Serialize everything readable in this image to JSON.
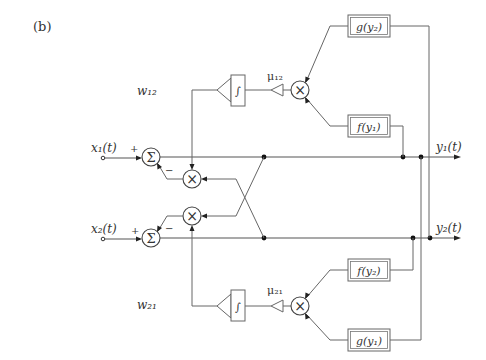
{
  "figure": {
    "panel_label": "(b)",
    "inputs": [
      {
        "label": "x₁(t)",
        "sum_plus": "+",
        "sum_minus": "−"
      },
      {
        "label": "x₂(t)",
        "sum_plus": "+",
        "sum_minus": "−"
      }
    ],
    "outputs": [
      {
        "label": "y₁(t)"
      },
      {
        "label": "y₂(t)"
      }
    ],
    "sum_symbol": "Σ",
    "multiply_symbol": "×",
    "integral_symbol": "∫",
    "weights": [
      {
        "label": "w₁₂",
        "gain": "μ₁₂"
      },
      {
        "label": "w₂₁",
        "gain": "μ₂₁"
      }
    ],
    "nonlinear_blocks": {
      "top_upper": "g(y₂)",
      "top_lower": "f(y₁)",
      "bottom_upper": "f(y₂)",
      "bottom_lower": "g(y₁)"
    }
  }
}
